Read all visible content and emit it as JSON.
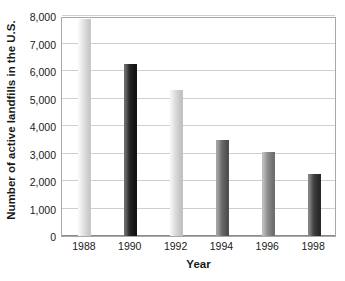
{
  "chart_data": {
    "type": "bar",
    "title": "",
    "subtitle": "",
    "xlabel": "Year",
    "ylabel": "Number of active landfills in the U.S.",
    "categories": [
      "1988",
      "1990",
      "1992",
      "1994",
      "1996",
      "1998"
    ],
    "values": [
      7900,
      6250,
      5300,
      3500,
      3050,
      2250
    ],
    "series": [
      {
        "name": "Active landfills",
        "values": [
          7900,
          6250,
          5300,
          3500,
          3050,
          2250
        ]
      }
    ],
    "ylim": [
      0,
      8000
    ],
    "ytick_values": [
      0,
      1000,
      2000,
      3000,
      4000,
      5000,
      6000,
      7000,
      8000
    ],
    "ytick_labels": [
      "0",
      "1,000",
      "2,000",
      "3,000",
      "4,000",
      "5,000",
      "6,000",
      "7,000",
      "8,000"
    ],
    "xtick_labels": [
      "1988",
      "1990",
      "1992",
      "1994",
      "1996",
      "1998"
    ],
    "grid": true,
    "grid_axis": "y",
    "legend": false,
    "legend_position": "none",
    "annotations": [],
    "bar_colors": [
      "#e3e3e3",
      "#2b2b2b",
      "#dcdcdc",
      "#6e6e6e",
      "#8e8e8e",
      "#4a4a4a"
    ],
    "bar_gradients": [
      {
        "light": "#f7f7f7",
        "mid": "#e0e0e0",
        "dark": "#c9c9c9"
      },
      {
        "light": "#6a6a6a",
        "mid": "#242424",
        "dark": "#131313"
      },
      {
        "light": "#f2f2f2",
        "mid": "#d9d9d9",
        "dark": "#c2c2c2"
      },
      {
        "light": "#a3a3a3",
        "mid": "#6b6b6b",
        "dark": "#4f4f4f"
      },
      {
        "light": "#bdbdbd",
        "mid": "#8c8c8c",
        "dark": "#6f6f6f"
      },
      {
        "light": "#838383",
        "mid": "#3f3f3f",
        "dark": "#282828"
      }
    ],
    "axis_color": "#a8a8a8",
    "gridline_color": "#cfcfcf",
    "text_color": "#1a1a1a",
    "background_color": "#ffffff"
  }
}
